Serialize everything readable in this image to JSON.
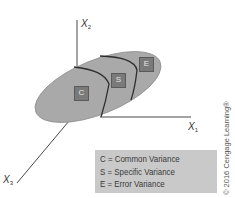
{
  "figure": {
    "top_cutoff_text": "",
    "axes": {
      "x1": {
        "label": "X",
        "subscript": "1"
      },
      "x2": {
        "label": "X",
        "subscript": "2"
      },
      "x3": {
        "label": "X",
        "subscript": "3"
      }
    },
    "regions": [
      {
        "code": "C",
        "meaning": "Common Variance"
      },
      {
        "code": "S",
        "meaning": "Specific Variance"
      },
      {
        "code": "E",
        "meaning": "Error Variance"
      }
    ],
    "legend": {
      "items": [
        "C = Common Variance",
        "S = Specific Variance",
        "E = Error Variance"
      ]
    },
    "copyright": "© 2016 Cengage Learning®",
    "colors": {
      "ellipse_fill": "#a9a9a9",
      "ellipse_stroke": "#8c8c8c",
      "box_fill": "#7a7a7a",
      "legend_bg": "#c9c9c9",
      "axis": "#333333",
      "divider": "#2e2e2e"
    }
  }
}
